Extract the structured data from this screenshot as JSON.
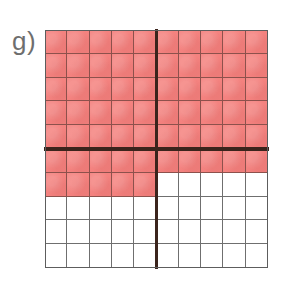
{
  "figure": {
    "label": "g)",
    "label_name": "part-label-g",
    "type": "fraction-grid",
    "grid": {
      "columns": 10,
      "rows": 10,
      "total_cells": 100,
      "shaded_cells": 65,
      "unshaded_cells": 35,
      "fraction": "65/100",
      "quadrant_divider_after_column": 5,
      "quadrant_divider_after_row": 5,
      "shaded_row_counts": [
        10,
        10,
        10,
        10,
        10,
        10,
        5,
        0,
        0,
        0
      ]
    },
    "colors": {
      "shaded_fill": "#f4827f",
      "unshaded_fill": "#ffffff",
      "thin_gridline": "#6f6f6f",
      "thin_gridline_shaded": "#8d514c",
      "thick_divider": "#3b241c",
      "outline": "#5d5d5d",
      "label_text": "#6e6e6e",
      "background": "#ffffff"
    }
  },
  "chart_data": {
    "type": "heatmap",
    "title": "g)",
    "xlabel": "",
    "ylabel": "",
    "categories": [
      "1",
      "2",
      "3",
      "4",
      "5",
      "6",
      "7",
      "8",
      "9",
      "10"
    ],
    "rows": [
      "1",
      "2",
      "3",
      "4",
      "5",
      "6",
      "7",
      "8",
      "9",
      "10"
    ],
    "values": [
      [
        1,
        1,
        1,
        1,
        1,
        1,
        1,
        1,
        1,
        1
      ],
      [
        1,
        1,
        1,
        1,
        1,
        1,
        1,
        1,
        1,
        1
      ],
      [
        1,
        1,
        1,
        1,
        1,
        1,
        1,
        1,
        1,
        1
      ],
      [
        1,
        1,
        1,
        1,
        1,
        1,
        1,
        1,
        1,
        1
      ],
      [
        1,
        1,
        1,
        1,
        1,
        1,
        1,
        1,
        1,
        1
      ],
      [
        1,
        1,
        1,
        1,
        1,
        1,
        1,
        1,
        1,
        1
      ],
      [
        1,
        1,
        1,
        1,
        1,
        0,
        0,
        0,
        0,
        0
      ],
      [
        0,
        0,
        0,
        0,
        0,
        0,
        0,
        0,
        0,
        0
      ],
      [
        0,
        0,
        0,
        0,
        0,
        0,
        0,
        0,
        0,
        0
      ],
      [
        0,
        0,
        0,
        0,
        0,
        0,
        0,
        0,
        0,
        0
      ]
    ],
    "legend": [
      {
        "name": "shaded",
        "value": 1,
        "color": "#f4827f",
        "count": 65
      },
      {
        "name": "unshaded",
        "value": 0,
        "color": "#ffffff",
        "count": 35
      }
    ],
    "grid": true,
    "legend_position": "none",
    "annotations": [
      "65 of 100 squares shaded",
      "grid split into quadrants by bold lines at 5x5"
    ]
  }
}
